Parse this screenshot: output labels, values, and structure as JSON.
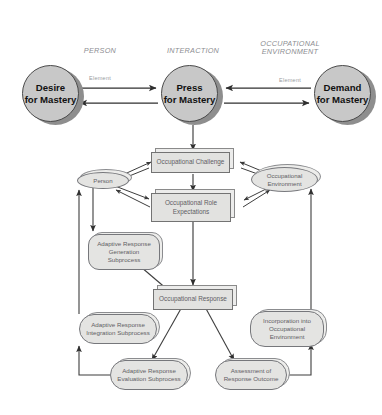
{
  "diagram": {
    "colors": {
      "circle_fill": "#c8c8c8",
      "circle_stroke": "#4a4a4a",
      "box_fill": "#e2e2e0",
      "box_stroke": "#737373",
      "node_text": "#5f6064",
      "header_text": "#8d8e92",
      "arrow": "#3a3a3a",
      "background": "#ffffff"
    }
  },
  "column_headers": [
    {
      "title": "PERSON",
      "subtitle": "Element"
    },
    {
      "title": "INTERACTION",
      "subtitle": "Element"
    },
    {
      "title": "OCCUPATIONAL\nENVIRONMENT",
      "subtitle": "Element"
    }
  ],
  "circles": [
    {
      "label": "Desire\nfor Mastery"
    },
    {
      "label": "Press\nfor Mastery"
    },
    {
      "label": "Demand\nfor Mastery"
    }
  ],
  "nodes": {
    "occupational_challenge": "Occupational Challenge",
    "person": "Person",
    "occupational_environment": "Occupational\nEnvironment",
    "occupational_role_expectations": "Occupational Role\nExpectations",
    "adaptive_response_generation": "Adaptive Response\nGeneration\nSubprocess",
    "occupational_response": "Occupational Response",
    "adaptive_response_integration": "Adaptive Response\nIntegration Subprocess",
    "incorporation_into_environment": "Incorporation into\nOccupational\nEnvironment",
    "adaptive_response_evaluation": "Adaptive Response\nEvaluation Subprocess",
    "assessment_of_response_outcome": "Assessment of\nResponse Outcome"
  }
}
